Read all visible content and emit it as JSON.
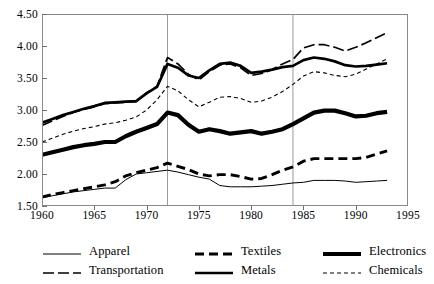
{
  "chart_data": {
    "type": "line",
    "title": "",
    "subtitle": "",
    "xlabel": "",
    "ylabel": "",
    "xlim": [
      1960,
      1995
    ],
    "ylim": [
      1.5,
      4.5
    ],
    "x_ticks": [
      1960,
      1965,
      1970,
      1975,
      1980,
      1985,
      1990,
      1995
    ],
    "y_ticks": [
      "1.50",
      "2.00",
      "2.50",
      "3.00",
      "3.50",
      "4.00",
      "4.50"
    ],
    "grid": "vertical gridlines at 1972 and 1984 only",
    "vertical_gridlines": [
      1972,
      1984
    ],
    "legend_position": "below plot, two rows of three",
    "x": [
      1960,
      1961,
      1962,
      1963,
      1964,
      1965,
      1966,
      1967,
      1968,
      1969,
      1970,
      1971,
      1972,
      1973,
      1974,
      1975,
      1976,
      1977,
      1978,
      1979,
      1980,
      1981,
      1982,
      1983,
      1984,
      1985,
      1986,
      1987,
      1988,
      1989,
      1990,
      1991,
      1992,
      1993
    ],
    "series": [
      {
        "name": "Apparel",
        "style": "thin-solid",
        "values": [
          1.63,
          1.66,
          1.69,
          1.72,
          1.74,
          1.76,
          1.78,
          1.78,
          1.91,
          2.0,
          2.02,
          2.04,
          2.06,
          2.03,
          1.99,
          1.95,
          1.92,
          1.82,
          1.8,
          1.8,
          1.8,
          1.81,
          1.82,
          1.84,
          1.86,
          1.87,
          1.9,
          1.9,
          1.9,
          1.89,
          1.87,
          1.88,
          1.89,
          1.9
        ]
      },
      {
        "name": "Textiles",
        "style": "thick-dashed",
        "values": [
          1.64,
          1.68,
          1.71,
          1.74,
          1.77,
          1.8,
          1.83,
          1.88,
          1.97,
          2.02,
          2.06,
          2.1,
          2.17,
          2.12,
          2.07,
          2.0,
          1.97,
          1.99,
          1.99,
          1.96,
          1.92,
          1.93,
          1.99,
          2.06,
          2.11,
          2.2,
          2.24,
          2.24,
          2.24,
          2.24,
          2.24,
          2.26,
          2.31,
          2.36
        ]
      },
      {
        "name": "Electronics",
        "style": "very-thick-solid",
        "values": [
          2.3,
          2.34,
          2.38,
          2.42,
          2.45,
          2.47,
          2.5,
          2.5,
          2.59,
          2.66,
          2.72,
          2.78,
          2.96,
          2.92,
          2.77,
          2.66,
          2.7,
          2.67,
          2.63,
          2.65,
          2.67,
          2.63,
          2.66,
          2.7,
          2.78,
          2.87,
          2.96,
          2.99,
          2.99,
          2.95,
          2.9,
          2.91,
          2.95,
          2.97
        ]
      },
      {
        "name": "Transportation",
        "style": "medium-dash",
        "values": [
          2.76,
          2.83,
          2.9,
          2.96,
          3.01,
          3.05,
          3.1,
          3.11,
          3.12,
          3.13,
          3.27,
          3.37,
          3.82,
          3.72,
          3.56,
          3.47,
          3.6,
          3.7,
          3.72,
          3.66,
          3.54,
          3.57,
          3.63,
          3.72,
          3.79,
          3.97,
          4.02,
          4.02,
          3.98,
          3.92,
          3.98,
          4.05,
          4.13,
          4.21
        ]
      },
      {
        "name": "Metals",
        "style": "thick-solid",
        "values": [
          2.8,
          2.86,
          2.92,
          2.97,
          3.02,
          3.06,
          3.11,
          3.12,
          3.13,
          3.14,
          3.26,
          3.36,
          3.72,
          3.66,
          3.54,
          3.5,
          3.62,
          3.72,
          3.74,
          3.69,
          3.58,
          3.6,
          3.63,
          3.67,
          3.69,
          3.78,
          3.82,
          3.8,
          3.76,
          3.7,
          3.68,
          3.69,
          3.71,
          3.73
        ]
      },
      {
        "name": "Chemicals",
        "style": "thin-dotted",
        "values": [
          2.5,
          2.56,
          2.62,
          2.67,
          2.71,
          2.74,
          2.78,
          2.8,
          2.84,
          2.89,
          3.0,
          3.16,
          3.37,
          3.3,
          3.16,
          3.05,
          3.12,
          3.2,
          3.21,
          3.18,
          3.12,
          3.14,
          3.2,
          3.29,
          3.4,
          3.53,
          3.6,
          3.58,
          3.54,
          3.52,
          3.56,
          3.64,
          3.72,
          3.8
        ]
      }
    ]
  },
  "axis": {
    "y_tick_labels": [
      "4.50",
      "4.00",
      "3.50",
      "3.00",
      "2.50",
      "2.00",
      "1.50"
    ],
    "x_tick_labels": [
      "1960",
      "1965",
      "1970",
      "1975",
      "1980",
      "1985",
      "1990",
      "1995"
    ]
  },
  "legend": {
    "rows": [
      [
        {
          "label": "Apparel",
          "style": "thin-solid"
        },
        {
          "label": "Textiles",
          "style": "thick-dashed"
        },
        {
          "label": "Electronics",
          "style": "very-thick-solid"
        }
      ],
      [
        {
          "label": "Transportation",
          "style": "medium-dash"
        },
        {
          "label": "Metals",
          "style": "thick-solid"
        },
        {
          "label": "Chemicals",
          "style": "thin-dotted"
        }
      ]
    ]
  },
  "colors": {
    "line": "#000000",
    "frame": "#8a8a8a",
    "gridline": "#9a9a9a",
    "background": "#ffffff"
  }
}
